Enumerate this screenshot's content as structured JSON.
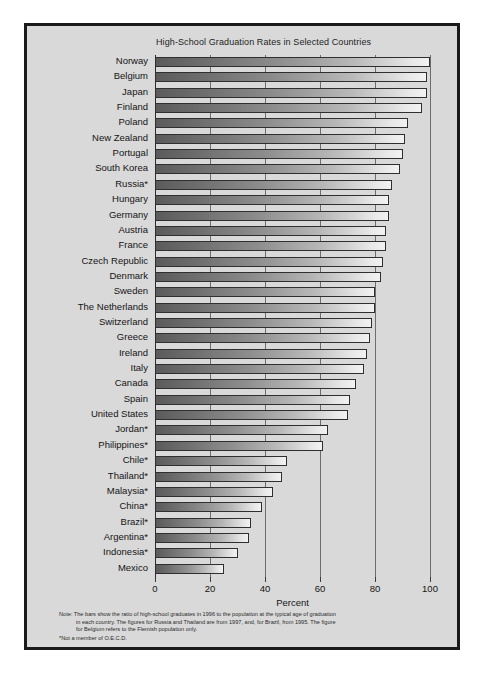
{
  "chart_data": {
    "type": "bar",
    "orientation": "horizontal",
    "title": "High-School Graduation Rates in Selected Countries",
    "xlabel": "Percent",
    "ylabel": "",
    "xlim": [
      0,
      100
    ],
    "xticks": [
      0,
      20,
      40,
      60,
      80,
      100
    ],
    "grid": true,
    "legend": null,
    "categories": [
      "Norway",
      "Belgium",
      "Japan",
      "Finland",
      "Poland",
      "New Zealand",
      "Portugal",
      "South Korea",
      "Russia*",
      "Hungary",
      "Germany",
      "Austria",
      "France",
      "Czech Republic",
      "Denmark",
      "Sweden",
      "The Netherlands",
      "Switzerland",
      "Greece",
      "Ireland",
      "Italy",
      "Canada",
      "Spain",
      "United States",
      "Jordan*",
      "Philippines*",
      "Chile*",
      "Thailand*",
      "Malaysia*",
      "China*",
      "Brazil*",
      "Argentina*",
      "Indonesia*",
      "Mexico"
    ],
    "values": [
      100,
      99,
      99,
      97,
      92,
      91,
      90,
      89,
      86,
      85,
      85,
      84,
      84,
      83,
      82,
      80,
      80,
      79,
      78,
      77,
      76,
      73,
      71,
      70,
      63,
      61,
      48,
      46,
      43,
      39,
      35,
      34,
      30,
      25
    ],
    "annotations": [
      "Note: The bars show the ratio of high-school graduates in 1996 to the population at the typical age of graduation in each country. The figures for Russia and Thailand are from 1997, and, for Brazil, from 1995. The figure for Belgium refers to the Flemish population only.",
      "*Not a member of O.E.C.D."
    ]
  },
  "footnote": {
    "line1": "Note: The bars show the ratio of high-school graduates in 1996 to the population at the typical age of graduation",
    "line2": "in each country. The figures for Russia and Thailand are from 1997, and, for Brazil, from 1995. The figure",
    "line3": "for Belgium refers to the Flemish population only.",
    "line4": "*Not a member of O.E.C.D."
  }
}
